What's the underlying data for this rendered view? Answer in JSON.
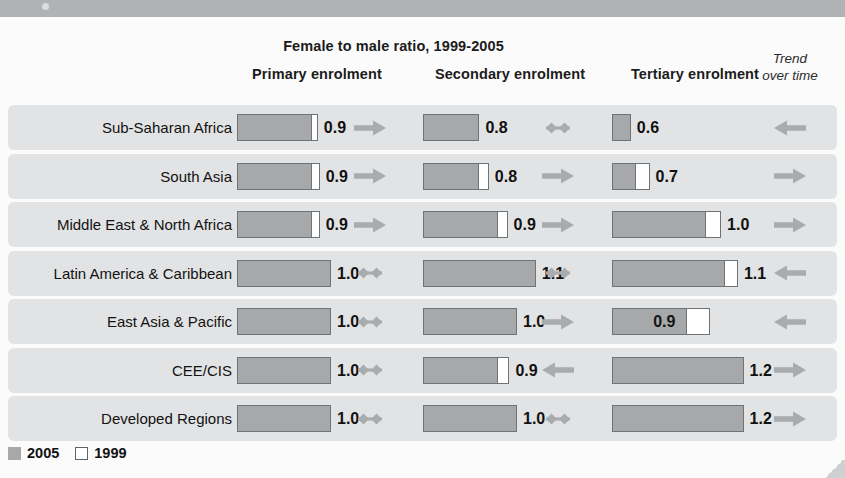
{
  "header": {
    "supertitle": "Female to male ratio, 1999-2005",
    "columns": [
      "Primary enrolment",
      "Secondary enrolment",
      "Tertiary enrolment"
    ],
    "trend_head_line1": "Trend",
    "trend_head_line2": "over time"
  },
  "legend": {
    "items": [
      {
        "label": "2005",
        "swatch": "gray-swatch"
      },
      {
        "label": "1999",
        "swatch": "white-swatch"
      }
    ]
  },
  "axis": {
    "ticks": [
      "0.5",
      "1.0"
    ],
    "tick_values": [
      0.5,
      1.0
    ],
    "xmin": 0.5,
    "xmax": 1.3
  },
  "colors": {
    "bar_2005": "#a6a8aa",
    "bar_1999": "#ffffff",
    "bar_outline": "#6f7376",
    "row_band": "#e2e3e4",
    "gridline": "#c9cacb",
    "arrow": "#a9abad",
    "top_bar": "#b0b2b4",
    "background": "#fbfbfb"
  },
  "chart_data": {
    "type": "bar",
    "title": "Female to male ratio, 1999-2005",
    "xlabel": "",
    "ylabel": "",
    "xlim": [
      0.5,
      1.3
    ],
    "grid": true,
    "legend_position": "bottom-left",
    "categories": [
      "Sub-Saharan Africa",
      "South Asia",
      "Middle East & North Africa",
      "Latin America & Caribbean",
      "East Asia & Pacific",
      "CEE/CIS",
      "Developed Regions"
    ],
    "panels": [
      {
        "name": "Primary enrolment",
        "series": [
          {
            "name": "2005",
            "values": [
              0.9,
              0.9,
              0.9,
              1.0,
              1.0,
              1.0,
              1.0
            ]
          },
          {
            "name": "1999",
            "values": [
              0.93,
              0.94,
              0.94,
              0.99,
              0.99,
              0.99,
              1.0
            ]
          }
        ],
        "labels": [
          "0.9",
          "0.9",
          "0.9",
          "1.0",
          "1.0",
          "1.0",
          "1.0"
        ],
        "trend": [
          "right",
          "right",
          "right",
          "flat",
          "flat",
          "flat",
          "flat"
        ]
      },
      {
        "name": "Secondary enrolment",
        "series": [
          {
            "name": "2005",
            "values": [
              0.8,
              0.8,
              0.9,
              1.1,
              1.0,
              0.9,
              1.0
            ]
          },
          {
            "name": "1999",
            "values": [
              0.8,
              0.85,
              0.95,
              1.1,
              1.0,
              0.96,
              1.0
            ]
          }
        ],
        "labels": [
          "0.8",
          "0.8",
          "0.9",
          "1.1",
          "1.0",
          "0.9",
          "1.0"
        ],
        "trend": [
          "flat",
          "right",
          "right",
          "flat",
          "right",
          "left",
          "flat"
        ]
      },
      {
        "name": "Tertiary enrolment",
        "series": [
          {
            "name": "2005",
            "values": [
              0.6,
              0.63,
              1.0,
              1.1,
              0.9,
              1.2,
              1.2
            ]
          },
          {
            "name": "1999",
            "values": [
              0.6,
              0.7,
              1.08,
              1.17,
              1.02,
              1.2,
              1.2
            ]
          }
        ],
        "labels": [
          "0.6",
          "0.7",
          "1.0",
          "1.1",
          "0.9",
          "1.2",
          "1.2"
        ],
        "trend": [
          "left",
          "right",
          "right",
          "left",
          "left",
          "right",
          "right"
        ]
      }
    ],
    "trend_over_time": [
      "left",
      "right",
      "right",
      "left",
      "left",
      "right",
      "right"
    ]
  }
}
